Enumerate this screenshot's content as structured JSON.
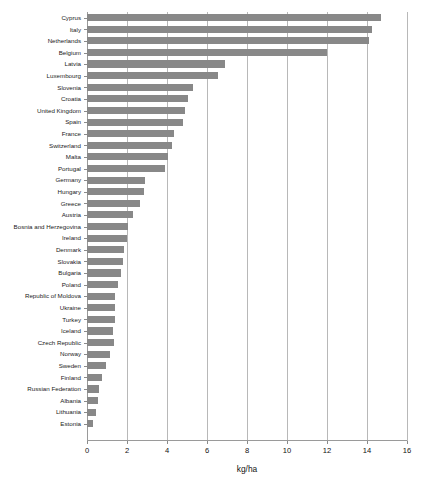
{
  "chart_data": {
    "type": "bar",
    "orientation": "horizontal",
    "title": "",
    "subtitle": "",
    "xlabel": "kg/ha",
    "ylabel": "",
    "xlim": [
      0,
      16
    ],
    "xticks": [
      0,
      2,
      4,
      6,
      8,
      10,
      12,
      14,
      16
    ],
    "xtick_labels": [
      "0",
      "2",
      "4",
      "6",
      "8",
      "10",
      "12",
      "14",
      "16"
    ],
    "grid": true,
    "grid_axis": "x",
    "legend": false,
    "legend_position": "none",
    "bar_color": "#888888",
    "gridline_color": "#b8b8b8",
    "categories": [
      "Cyprus",
      "Italy",
      "Netherlands",
      "Belgium",
      "Latvia",
      "Luxembourg",
      "Slovenia",
      "Croatia",
      "United Kingdom",
      "Spain",
      "France",
      "Switzerland",
      "Malta",
      "Portugal",
      "Germany",
      "Hungary",
      "Greece",
      "Austria",
      "Bosnia and Herzegovina",
      "Ireland",
      "Denmark",
      "Slovakia",
      "Bulgaria",
      "Poland",
      "Republic of Moldova",
      "Ukraine",
      "Turkey",
      "Iceland",
      "Czech Republic",
      "Norway",
      "Sweden",
      "Finland",
      "Russian Federation",
      "Albania",
      "Lithuania",
      "Estonia"
    ],
    "values": [
      14.7,
      14.25,
      14.1,
      12.0,
      6.9,
      6.55,
      5.3,
      5.05,
      4.9,
      4.8,
      4.35,
      4.25,
      4.05,
      3.9,
      2.9,
      2.85,
      2.65,
      2.3,
      2.05,
      1.98,
      1.85,
      1.82,
      1.72,
      1.55,
      1.4,
      1.42,
      1.38,
      1.3,
      1.33,
      1.15,
      0.95,
      0.75,
      0.6,
      0.55,
      0.45,
      0.3
    ],
    "units": "kg/ha"
  }
}
